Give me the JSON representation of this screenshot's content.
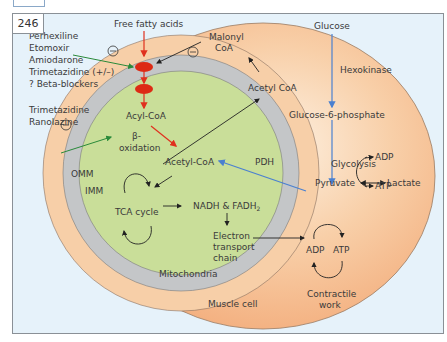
{
  "figure": {
    "number": "246",
    "colors": {
      "background": "#e6f2fa",
      "cytoplasm": "#f5b688",
      "outer_membrane": "#f7d6b8",
      "intermembrane": "#c4c6c8",
      "matrix": "#c9de99",
      "fatty_acid_arrow": "#e0301e",
      "glucose_arrow": "#4a80d0",
      "inhibitor_arrow": "#2a8a3a",
      "generic_arrow": "#222222",
      "transporter": "#dd2a14"
    }
  },
  "inhibitors": {
    "group1": [
      "Perhexiline",
      "Etomoxir",
      "Amiodarone",
      "Trimetazidine (+/–)",
      "? Beta-blockers"
    ],
    "group2": [
      "Trimetazidine",
      "Ranolazine"
    ],
    "minus_symbol": "⊖"
  },
  "labels": {
    "free_fatty_acids": "Free fatty acids",
    "malonyl_coa_line1": "Malonyl",
    "malonyl_coa_line2": "CoA",
    "acetyl_coa_cyto": "Acetyl CoA",
    "acyl_coa": "Acyl-CoA",
    "beta_ox_line1": "β-",
    "beta_ox_line2": "oxidation",
    "acetyl_coa_mito": "Acetyl-CoA",
    "pdh": "PDH",
    "omm": "OMM",
    "imm": "IMM",
    "tca_cycle": "TCA cycle",
    "nadh": "NADH & FADH",
    "nadh_sub": "2",
    "etc_line1": "Electron",
    "etc_line2": "transport",
    "etc_line3": "chain",
    "mitochondria": "Mitochondria",
    "muscle_cell": "Muscle cell",
    "glucose": "Glucose",
    "hexokinase": "Hexokinase",
    "g6p": "Glucose-6-phosphate",
    "glycolysis": "Glycolysis",
    "adp_glyc": "ADP",
    "atp_glyc": "ATP",
    "pyruvate": "Pyruvate",
    "lactate": "Lactate",
    "adp_work": "ADP",
    "atp_work": "ATP",
    "contractile_line1": "Contractile",
    "contractile_line2": "work"
  }
}
